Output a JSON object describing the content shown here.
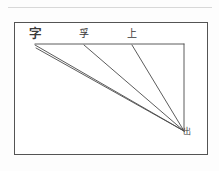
{
  "page": {
    "background_color": "#fdfdfd",
    "top_rule_color": "#d8d8d8"
  },
  "figure": {
    "frame": {
      "border_color": "#545454",
      "fill_color": "#ffffff",
      "x": 14,
      "y": 22,
      "width": 194,
      "height": 133
    },
    "line_color": "#4a4a4a",
    "vertices": {
      "top_left": {
        "x": 35,
        "y": 44
      },
      "top_right": {
        "x": 184,
        "y": 44
      },
      "bottom_right": {
        "x": 184,
        "y": 131
      }
    },
    "strokes": [
      {
        "name": "top-horizontal-edge",
        "x1": 35,
        "y1": 44,
        "x2": 184,
        "y2": 44
      },
      {
        "name": "right-vertical-edge",
        "x1": 184,
        "y1": 44,
        "x2": 184,
        "y2": 131
      },
      {
        "name": "diagonal-from-left-upper",
        "x1": 35,
        "y1": 45,
        "x2": 184,
        "y2": 131
      },
      {
        "name": "diagonal-from-left-lower",
        "x1": 36,
        "y1": 48,
        "x2": 184,
        "y2": 131
      },
      {
        "name": "diagonal-from-middle",
        "x1": 84,
        "y1": 45,
        "x2": 184,
        "y2": 131
      },
      {
        "name": "diagonal-from-right-of-middle",
        "x1": 132,
        "y1": 45,
        "x2": 184,
        "y2": 131
      }
    ],
    "labels": [
      {
        "name": "label-left",
        "text": "字",
        "x": 29,
        "y": 28
      },
      {
        "name": "label-mid",
        "text": "孚",
        "x": 79,
        "y": 29
      },
      {
        "name": "label-right",
        "text": "上",
        "x": 127,
        "y": 29
      },
      {
        "name": "label-vertex",
        "text": "出",
        "x": 183,
        "y": 128
      }
    ]
  }
}
